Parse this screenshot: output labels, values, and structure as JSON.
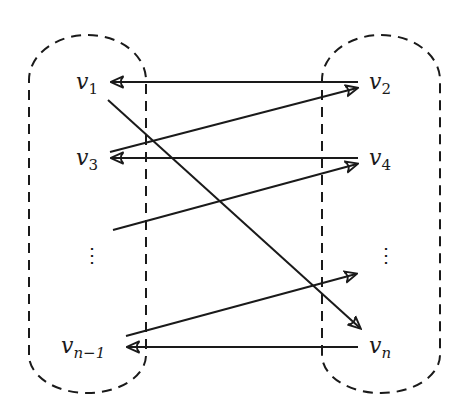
{
  "diagram": {
    "colors": {
      "stroke": "#1a1a1a",
      "background": "#ffffff"
    },
    "groups": [
      {
        "id": "left-group",
        "style": "dashed rounded capsule",
        "vertices": [
          "v1",
          "v3",
          "vdots",
          "v_{n-1}"
        ]
      },
      {
        "id": "right-group",
        "style": "dashed rounded capsule",
        "vertices": [
          "v2",
          "v4",
          "vdots",
          "v_n"
        ]
      }
    ],
    "labels": {
      "v1": {
        "base": "v",
        "sub": "1"
      },
      "v2": {
        "base": "v",
        "sub": "2"
      },
      "v3": {
        "base": "v",
        "sub": "3"
      },
      "v4": {
        "base": "v",
        "sub": "4"
      },
      "vn1": {
        "base": "v",
        "sub": "n−1"
      },
      "vn": {
        "base": "v",
        "sub": "n"
      },
      "vdots_left": "⋮",
      "vdots_right": "⋮"
    },
    "edges": [
      {
        "from": "v2",
        "to": "v1"
      },
      {
        "from": "v3",
        "to": "v2"
      },
      {
        "from": "v4",
        "to": "v3"
      },
      {
        "from": "vdots_left",
        "to": "v4"
      },
      {
        "from": "v1",
        "to": "v_n"
      },
      {
        "from": "v_{n-1}",
        "to": "vdots_right"
      },
      {
        "from": "v_n",
        "to": "v_{n-1}"
      }
    ]
  }
}
